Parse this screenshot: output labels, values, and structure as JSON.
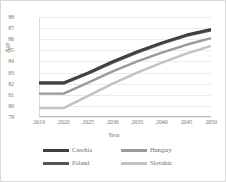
{
  "chart_data": {
    "type": "line",
    "title": "",
    "xlabel": "Year",
    "ylabel": "Age",
    "categories": [
      "2019",
      "2020",
      "2025",
      "2030",
      "2035",
      "2040",
      "2045",
      "2050"
    ],
    "ylim": [
      79,
      88
    ],
    "yticks": [
      88,
      87,
      86,
      85,
      84,
      83,
      82,
      81,
      80,
      79
    ],
    "grid": true,
    "legend_position": "bottom",
    "series": [
      {
        "name": "Czechia",
        "color": "#3f3f3f",
        "values": [
          82.1,
          82.1,
          83.0,
          84.0,
          84.9,
          85.7,
          86.4,
          86.9
        ]
      },
      {
        "name": "Hungary",
        "color": "#9a9a9a",
        "values": [
          81.1,
          81.1,
          82.1,
          83.1,
          84.0,
          84.8,
          85.5,
          86.1
        ]
      },
      {
        "name": "Poland",
        "color": "#555555",
        "values": [
          82.0,
          82.0,
          82.9,
          83.9,
          84.8,
          85.6,
          86.3,
          86.8
        ]
      },
      {
        "name": "Slovakia",
        "color": "#c2c2c2",
        "values": [
          79.8,
          79.8,
          80.9,
          82.0,
          83.0,
          83.9,
          84.7,
          85.4
        ]
      }
    ]
  }
}
